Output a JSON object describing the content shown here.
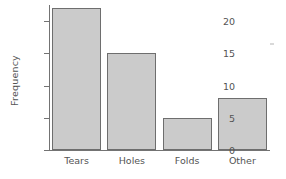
{
  "chart_data": {
    "type": "bar",
    "title": "",
    "subtitle": "",
    "xlabel": "",
    "ylabel": "Frequency",
    "categories": [
      "Tears",
      "Holes",
      "Folds",
      "Other"
    ],
    "values": [
      22,
      15,
      5,
      8
    ],
    "series": [
      {
        "name": "Frequency",
        "values": [
          22,
          15,
          5,
          8
        ]
      }
    ],
    "ylim": [
      0,
      22.5
    ],
    "yticks": [
      0,
      5,
      10,
      15,
      20
    ],
    "ytick_labels": [
      "0",
      "5",
      "10",
      "15",
      "20"
    ],
    "grid": false,
    "legend": false,
    "legend_position": "none",
    "bar_fill_color": "#cbcbcb",
    "bar_edge_color": "#6e6e6e",
    "axis_color": "#737373",
    "text_color": "#545454",
    "background_color": "#ffffff",
    "annotations": []
  },
  "figure": {
    "y_axis_title": "Frequency",
    "speck_label": "scan-artifact"
  }
}
